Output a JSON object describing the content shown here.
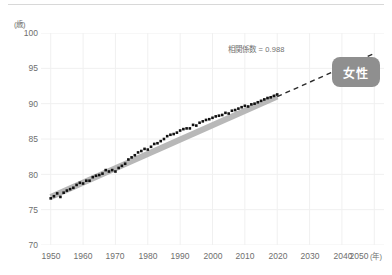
{
  "axes": {
    "y_unit_label": "(歳)",
    "y_ticks": [
      "100",
      "95",
      "90",
      "85",
      "80",
      "75",
      "70"
    ],
    "x_ticks": [
      "1950",
      "1960",
      "1970",
      "1980",
      "1990",
      "2000",
      "2010",
      "2020",
      "2030",
      "2040",
      "2050"
    ],
    "x_unit_label": "(年)"
  },
  "annotations": {
    "correlation": "相関係数 = 0.988",
    "sex_badge": "女性"
  },
  "colors": {
    "axis_text": "#6e6e6e",
    "marker": "#111111",
    "trend_band": "#b8b8b8",
    "dashed_line": "#2a2a2a",
    "badge_bg": "#8f8f8f",
    "gridline": "#f0f0f0",
    "top_rule": "#d8d8d8"
  },
  "chart_data": {
    "type": "scatter",
    "title": "",
    "xlabel": "(年)",
    "ylabel": "(歳)",
    "xlim": [
      1947,
      2053
    ],
    "ylim": [
      70,
      100
    ],
    "grid": true,
    "legend_position": "none",
    "series": [
      {
        "name": "女性 平均寿命",
        "marker": "square",
        "color": "#111111",
        "x": [
          1950,
          1951,
          1952,
          1953,
          1954,
          1955,
          1956,
          1957,
          1958,
          1959,
          1960,
          1961,
          1962,
          1963,
          1964,
          1965,
          1966,
          1967,
          1968,
          1969,
          1970,
          1971,
          1972,
          1973,
          1974,
          1975,
          1976,
          1977,
          1978,
          1979,
          1980,
          1981,
          1982,
          1983,
          1984,
          1985,
          1986,
          1987,
          1988,
          1989,
          1990,
          1991,
          1992,
          1993,
          1994,
          1995,
          1996,
          1997,
          1998,
          1999,
          2000,
          2001,
          2002,
          2003,
          2004,
          2005,
          2006,
          2007,
          2008,
          2009,
          2010,
          2011,
          2012,
          2013,
          2014,
          2015,
          2016,
          2017,
          2018,
          2019,
          2020
        ],
        "y": [
          76.6,
          76.9,
          77.3,
          76.8,
          77.4,
          77.7,
          77.9,
          78.1,
          78.5,
          78.8,
          78.7,
          79.1,
          79.1,
          79.6,
          79.8,
          79.9,
          80.1,
          80.6,
          80.4,
          80.6,
          80.4,
          80.9,
          81.2,
          81.5,
          82.1,
          82.4,
          82.7,
          83.1,
          83.3,
          83.6,
          83.5,
          83.9,
          84.3,
          84.4,
          84.7,
          85.0,
          85.4,
          85.6,
          85.7,
          85.9,
          86.2,
          86.4,
          86.5,
          86.5,
          87.0,
          86.9,
          87.3,
          87.5,
          87.7,
          87.8,
          88.0,
          88.2,
          88.3,
          88.4,
          88.7,
          88.6,
          89.0,
          89.1,
          89.3,
          89.5,
          89.7,
          89.6,
          89.9,
          90.0,
          90.2,
          90.4,
          90.6,
          90.8,
          90.9,
          91.1,
          91.3
        ]
      }
    ],
    "trend": {
      "name": "回帰直線",
      "style": "solid-band",
      "x": [
        1950,
        2020
      ],
      "y": [
        76.8,
        91.0
      ]
    },
    "projection": {
      "name": "外挿（点線）",
      "style": "dashed",
      "x": [
        2020,
        2050
      ],
      "y": [
        91.0,
        97.1
      ]
    },
    "correlation_coefficient": 0.988
  }
}
